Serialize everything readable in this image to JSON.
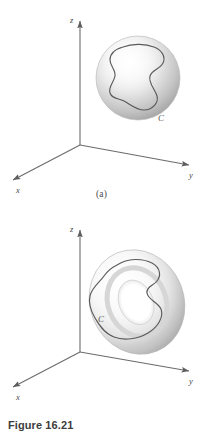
{
  "figure": {
    "caption": "Figure 16.21",
    "panels": [
      {
        "id": "a",
        "sub_label": "(a)",
        "surface": "sphere",
        "curve_label": "C",
        "axes": {
          "x": "x",
          "y": "y",
          "z": "z"
        }
      },
      {
        "id": "b",
        "sub_label": "(b)",
        "surface": "torus",
        "curve_label": "C",
        "axes": {
          "x": "x",
          "y": "y",
          "z": "z"
        }
      }
    ]
  },
  "colors": {
    "background": "#ffffff",
    "axis_line": "#6b6b6b",
    "curve": "#555555",
    "surface_light": "#fcfcfc",
    "surface_mid": "#dcdcdc",
    "surface_dark": "#a8a8a8",
    "text": "#3d3d3d"
  }
}
